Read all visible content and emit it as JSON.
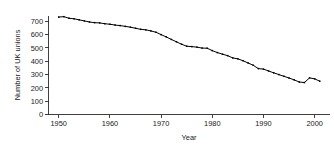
{
  "chart_data": {
    "type": "line",
    "title": "",
    "xlabel": "Year",
    "ylabel": "Number of UK unions",
    "xlim": [
      1948,
      2003
    ],
    "ylim": [
      0,
      740
    ],
    "grid": false,
    "legend": false,
    "marker": "square",
    "line_color": "#000000",
    "xticks": [
      1950,
      1960,
      1970,
      1980,
      1990,
      2000
    ],
    "xticklabels": [
      "1950",
      "1960",
      "1970",
      "1980",
      "1990",
      "2000"
    ],
    "yticks": [
      0,
      100,
      200,
      300,
      400,
      500,
      600,
      700
    ],
    "yticklabels": [
      "0",
      "100",
      "200",
      "300",
      "400",
      "500",
      "600",
      "700"
    ],
    "x": [
      1950,
      1951,
      1952,
      1953,
      1954,
      1955,
      1956,
      1957,
      1958,
      1959,
      1960,
      1961,
      1962,
      1963,
      1964,
      1965,
      1966,
      1967,
      1968,
      1969,
      1970,
      1971,
      1972,
      1973,
      1974,
      1975,
      1976,
      1977,
      1978,
      1979,
      1980,
      1981,
      1982,
      1983,
      1984,
      1985,
      1986,
      1987,
      1988,
      1989,
      1990,
      1991,
      1992,
      1993,
      1994,
      1995,
      1996,
      1997,
      1998,
      1999,
      2000,
      2001
    ],
    "values": [
      732,
      735,
      723,
      719,
      711,
      703,
      695,
      690,
      688,
      682,
      678,
      672,
      668,
      662,
      656,
      648,
      640,
      636,
      628,
      618,
      600,
      583,
      564,
      546,
      528,
      513,
      510,
      506,
      499,
      498,
      480,
      465,
      453,
      442,
      425,
      418,
      404,
      387,
      370,
      345,
      341,
      327,
      313,
      300,
      287,
      274,
      260,
      244,
      240,
      275,
      268,
      250
    ]
  },
  "figure": {
    "axis_color": "#2a2a2a",
    "background": "#ffffff",
    "text_color": "#1a1a1a"
  }
}
